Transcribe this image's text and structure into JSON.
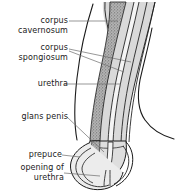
{
  "figure": {
    "type": "anatomical-diagram",
    "width": 186,
    "height": 193,
    "background_color": "#ffffff",
    "line_color": "#1a1a1a",
    "colors": {
      "outline": "#1a1a1a",
      "leader_line": "#5a5a5a",
      "corpus_cavernosum_fill": "#9b9b9b",
      "corpus_spongiosum_fill": "#d6d6d6",
      "glans_fill": "#dedede",
      "prepuce_fill": "#e8e8e8",
      "text": "#1a1a1a"
    }
  },
  "labels": [
    {
      "id": "corpus-cavernosum",
      "text": "corpus\ncavernosum",
      "lines": [
        "corpus",
        "cavernosum"
      ],
      "x": 6,
      "y": 16,
      "width": 62
    },
    {
      "id": "corpus-spongiosum",
      "text": "corpus\nspongiosum",
      "lines": [
        "corpus",
        "spongiosum"
      ],
      "x": 4,
      "y": 43,
      "width": 64
    },
    {
      "id": "urethra",
      "text": "urethra",
      "lines": [
        "urethra"
      ],
      "x": 8,
      "y": 79,
      "width": 60
    },
    {
      "id": "glans-penis",
      "text": "glans penis",
      "lines": [
        "glans penis"
      ],
      "x": 4,
      "y": 112,
      "width": 64
    },
    {
      "id": "prepuce",
      "text": "prepuce",
      "lines": [
        "prepuce"
      ],
      "x": 8,
      "y": 150,
      "width": 56
    },
    {
      "id": "opening-of-urethra",
      "text": "opening of\nurethra",
      "lines": [
        "opening of",
        "urethra"
      ],
      "x": 4,
      "y": 163,
      "width": 60
    }
  ],
  "structures": [
    {
      "id": "corpus-cavernosum-band",
      "name": "corpus cavernosum",
      "fill": "#9b9b9b",
      "texture": "stippled"
    },
    {
      "id": "corpus-spongiosum-band",
      "name": "corpus spongiosum",
      "fill": "#d6d6d6",
      "texture": "plain"
    },
    {
      "id": "urethra-channel",
      "name": "urethra",
      "fill": "#ffffff",
      "texture": "line-pair"
    },
    {
      "id": "glans-penis-body",
      "name": "glans penis",
      "fill": "#dedede",
      "texture": "plain"
    },
    {
      "id": "prepuce-fold",
      "name": "prepuce",
      "fill": "#e8e8e8",
      "texture": "plain"
    },
    {
      "id": "urethral-opening",
      "name": "opening of urethra",
      "fill": "#ffffff",
      "texture": "plain"
    },
    {
      "id": "body-wall-outline",
      "name": "body wall",
      "fill": "none",
      "texture": "outline"
    }
  ],
  "leaders": [
    {
      "id": "leader-corpus-cavernosum",
      "from": "corpus-cavernosum",
      "to": "corpus-cavernosum-band"
    },
    {
      "id": "leader-corpus-spongiosum-upper",
      "from": "corpus-spongiosum",
      "to": "corpus-spongiosum-band"
    },
    {
      "id": "leader-corpus-spongiosum-lower",
      "from": "corpus-spongiosum",
      "to": "corpus-spongiosum-band"
    },
    {
      "id": "leader-urethra",
      "from": "urethra",
      "to": "urethra-channel"
    },
    {
      "id": "leader-glans-penis",
      "from": "glans-penis",
      "to": "glans-penis-body"
    },
    {
      "id": "leader-prepuce",
      "from": "prepuce",
      "to": "prepuce-fold"
    },
    {
      "id": "leader-opening-of-urethra",
      "from": "opening-of-urethra",
      "to": "urethral-opening"
    }
  ]
}
